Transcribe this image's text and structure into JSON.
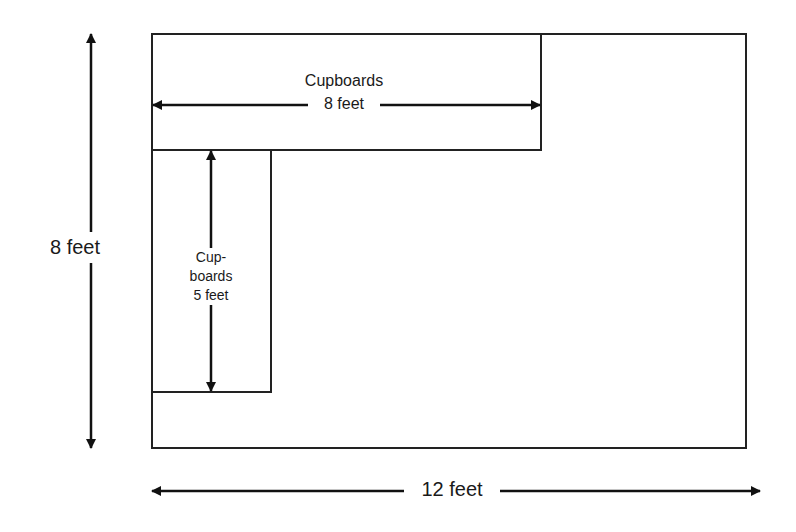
{
  "diagram": {
    "room": {
      "width_label": "12 feet",
      "height_label": "8 feet"
    },
    "top_cupboard": {
      "name": "Cupboards",
      "length_label": "8 feet"
    },
    "side_cupboard": {
      "name_line1": "Cup-",
      "name_line2": "boards",
      "length_label": "5 feet"
    }
  }
}
